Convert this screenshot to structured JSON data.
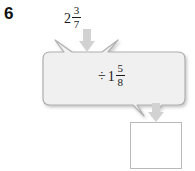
{
  "problem": {
    "number": "6"
  },
  "input": {
    "operator": "",
    "whole": "2",
    "numerator": "3",
    "denominator": "7",
    "label": "2 3/7"
  },
  "machine": {
    "operator": "÷",
    "whole": "1",
    "numerator": "5",
    "denominator": "8",
    "label": "÷ 1 5/8",
    "fill_color": "#f0f0f0",
    "border_color": "#b0b0b0"
  },
  "output": {
    "value": "",
    "placeholder": "",
    "border_color": "#b9b9b9",
    "fill_color": "#ffffff"
  },
  "arrows": {
    "color": "#d2d2d2",
    "input_arrow": "down-arrow",
    "output_arrow": "down-arrow"
  }
}
